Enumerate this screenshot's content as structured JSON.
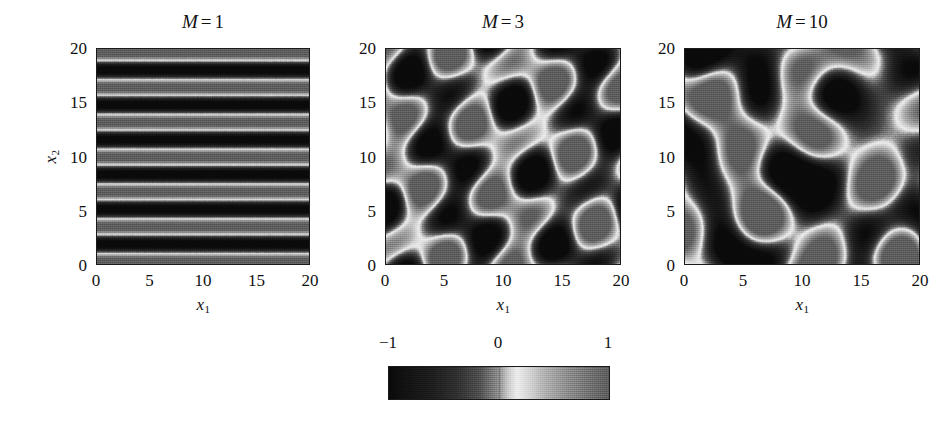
{
  "figure": {
    "kind": "grayscale-heatmap-triptych",
    "background": "#ffffff",
    "ink": "#111111"
  },
  "axis": {
    "x_label_main": "x",
    "x_label_sub": "1",
    "y_label_main": "x",
    "y_label_sub": "2",
    "ticks": [
      "0",
      "5",
      "10",
      "15",
      "20"
    ],
    "tick_values": [
      0,
      5,
      10,
      15,
      20
    ],
    "range": [
      0,
      20
    ]
  },
  "panels": [
    {
      "id": "panel-m1",
      "title_symbol": "M",
      "title_eq": "=",
      "title_value": "1",
      "title": "M = 1",
      "has_ylabel": true,
      "pattern": "horizontal-stripes"
    },
    {
      "id": "panel-m3",
      "title_symbol": "M",
      "title_eq": "=",
      "title_value": "3",
      "title": "M = 3",
      "has_ylabel": false,
      "pattern": "diagonal-blob-lattice"
    },
    {
      "id": "panel-m10",
      "title_symbol": "M",
      "title_eq": "=",
      "title_value": "10",
      "title": "M = 10",
      "has_ylabel": false,
      "pattern": "irregular-organic-blobs"
    }
  ],
  "colorbar": {
    "labels": [
      "−1",
      "0",
      "1"
    ],
    "label_values": [
      -1,
      0,
      1
    ],
    "range": [
      -1,
      1
    ],
    "orientation": "horizontal",
    "colormap": "nonmonotonic-gray",
    "stops": [
      {
        "v": -1.0,
        "gray": "#0a0a0a"
      },
      {
        "v": -0.82,
        "gray": "#141414"
      },
      {
        "v": -0.6,
        "gray": "#1e1e1e"
      },
      {
        "v": -0.38,
        "gray": "#303030"
      },
      {
        "v": -0.18,
        "gray": "#4e4e4e"
      },
      {
        "v": 0.0,
        "gray": "#8f8f8f"
      },
      {
        "v": 0.08,
        "gray": "#c8c8c8"
      },
      {
        "v": 0.16,
        "gray": "#ededed"
      },
      {
        "v": 0.26,
        "gray": "#d8d8d8"
      },
      {
        "v": 0.42,
        "gray": "#b0b0b0"
      },
      {
        "v": 0.62,
        "gray": "#8e8e8e"
      },
      {
        "v": 0.82,
        "gray": "#727272"
      },
      {
        "v": 1.0,
        "gray": "#5e5e5e"
      }
    ]
  },
  "chart_data": {
    "type": "heatmap",
    "title": "",
    "xlabel": "x1",
    "ylabel": "x2",
    "xlim": [
      0,
      20
    ],
    "ylim": [
      0,
      20
    ],
    "xticks": [
      0,
      5,
      10,
      15,
      20
    ],
    "yticks": [
      0,
      5,
      10,
      15,
      20
    ],
    "grid": false,
    "legend": "colorbar-below-center",
    "colorbar_range": [
      -1,
      1
    ],
    "colorbar_ticks": [
      -1,
      0,
      1
    ],
    "panel_count": 3,
    "panels": [
      {
        "title": "M = 1",
        "M": 1,
        "description": "Single Fourier mode: purely horizontal stripes, field varies only with x2.",
        "bright_band_centers_x2": [
          0.2,
          3.6,
          6.6,
          9.9,
          13.1,
          16.2,
          19.5
        ],
        "stripe_period_x2": 3.25,
        "stripe_orientation_deg": 0,
        "value_min": -1,
        "value_max": 1
      },
      {
        "title": "M = 3",
        "M": 3,
        "description": "Three superposed modes: quasi-regular lattice of dark ovoid cells tilted about -30 degrees, separated by bright ridges.",
        "dark_cell_centers": [
          [
            2.2,
            17.3
          ],
          [
            5.8,
            18.4
          ],
          [
            9.6,
            17.0
          ],
          [
            13.2,
            18.3
          ],
          [
            16.8,
            17.2
          ],
          [
            19.8,
            18.5
          ],
          [
            1.6,
            11.3
          ],
          [
            5.3,
            12.0
          ],
          [
            9.1,
            10.9
          ],
          [
            12.7,
            11.9
          ],
          [
            16.4,
            10.8
          ],
          [
            19.6,
            12.2
          ],
          [
            2.4,
            4.6
          ],
          [
            6.0,
            5.4
          ],
          [
            9.7,
            4.3
          ],
          [
            13.4,
            5.3
          ],
          [
            17.0,
            4.4
          ],
          [
            19.9,
            5.6
          ]
        ],
        "lattice_spacing_x1": 3.6,
        "lattice_spacing_x2": 6.4,
        "cell_tilt_deg": -30,
        "value_min": -1,
        "value_max": 1
      },
      {
        "title": "M = 10",
        "M": 10,
        "description": "Ten superposed modes: irregular, connected dark lobes forming elongated chains running down-right, woven through a bright filament network.",
        "dark_lobe_centers": [
          [
            4.5,
            16.0
          ],
          [
            10.2,
            15.0
          ],
          [
            15.0,
            13.3
          ],
          [
            18.8,
            15.2
          ],
          [
            2.2,
            10.0
          ],
          [
            7.0,
            11.5
          ],
          [
            12.5,
            9.2
          ],
          [
            17.5,
            10.0
          ],
          [
            2.5,
            3.5
          ],
          [
            6.5,
            6.0
          ],
          [
            11.0,
            5.5
          ],
          [
            15.5,
            6.7
          ],
          [
            19.0,
            2.5
          ],
          [
            5.0,
            19.0
          ],
          [
            13.0,
            19.4
          ]
        ],
        "chain_orientation_deg": -20,
        "value_min": -1,
        "value_max": 1
      }
    ]
  }
}
